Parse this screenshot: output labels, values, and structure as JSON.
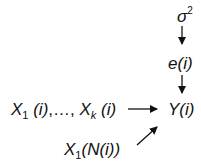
{
  "diagram": {
    "type": "causal-dependency-graph",
    "nodes": {
      "sigma": {
        "symbol": "σ",
        "superscript": "2"
      },
      "error": {
        "var": "e",
        "arg": "(i)"
      },
      "outcome": {
        "var": "Y",
        "arg": "(i)"
      },
      "covariates": {
        "first_var": "X",
        "first_sub": "1",
        "first_arg": " (i)",
        "sep": ",…, ",
        "last_var": "X",
        "last_sub": "k",
        "last_arg": " (i)"
      },
      "neighbor": {
        "var": "X",
        "sub": "1",
        "arg": "(N(i))"
      }
    },
    "edges": [
      {
        "from": "sigma",
        "to": "error"
      },
      {
        "from": "error",
        "to": "outcome"
      },
      {
        "from": "covariates",
        "to": "outcome"
      },
      {
        "from": "neighbor",
        "to": "outcome"
      }
    ],
    "colors": {
      "ink": "#111111",
      "background": "#ffffff"
    }
  }
}
